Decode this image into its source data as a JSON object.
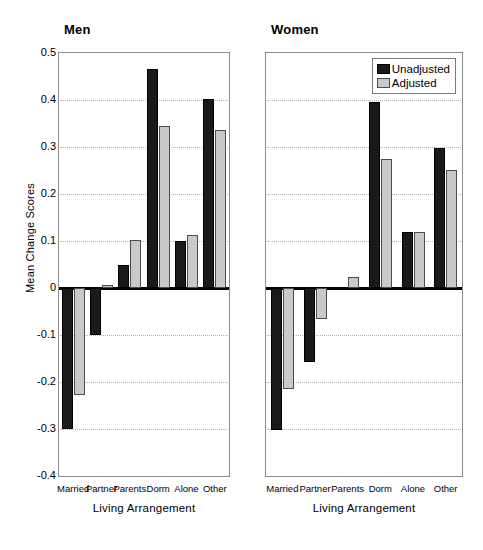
{
  "chart_data": {
    "type": "bar",
    "title": "",
    "xlabel": "Living Arrangement",
    "ylabel": "Mean Change Scores",
    "ylim": [
      -0.4,
      0.5
    ],
    "ytick_step": 0.1,
    "grid": true,
    "legend_position": "top-right of Women panel",
    "categories": [
      "Married",
      "Partner",
      "Parents",
      "Dorm",
      "Alone",
      "Other"
    ],
    "panels": [
      {
        "name": "Men",
        "series": [
          {
            "name": "Unadjusted",
            "values": [
              -0.3,
              -0.1,
              0.05,
              0.465,
              0.1,
              0.402
            ]
          },
          {
            "name": "Adjusted",
            "values": [
              -0.228,
              0.007,
              0.102,
              0.344,
              0.113,
              0.337
            ]
          }
        ]
      },
      {
        "name": "Women",
        "series": [
          {
            "name": "Unadjusted",
            "values": [
              -0.303,
              -0.158,
              0.0,
              0.395,
              0.12,
              0.298
            ]
          },
          {
            "name": "Adjusted",
            "values": [
              -0.215,
              -0.065,
              0.023,
              0.275,
              0.12,
              0.252
            ]
          }
        ]
      }
    ],
    "ytick_labels": [
      "0.5",
      "0.4",
      "0.3",
      "0.2",
      "0.1",
      "0",
      "-0.1",
      "-0.2",
      "-0.3",
      "-0.4"
    ],
    "colors": {
      "unadjusted": "#1a1a1a",
      "adjusted": "#c9c9c9",
      "axis": "#000000",
      "grid": "#b5b5b5"
    }
  },
  "legend": {
    "items": [
      {
        "label": "Unadjusted",
        "key": "unadjusted"
      },
      {
        "label": "Adjusted",
        "key": "adjusted"
      }
    ]
  },
  "panel_titles": {
    "left": "Men",
    "right": "Women"
  },
  "axis_titles": {
    "x": "Living Arrangement",
    "y": "Mean Change Scores"
  }
}
